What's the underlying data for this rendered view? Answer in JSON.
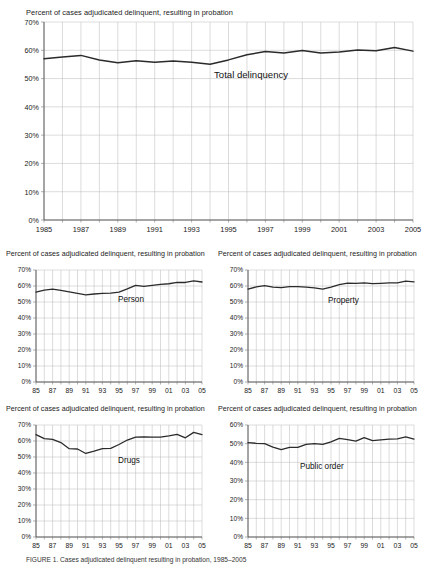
{
  "figure": {
    "caption": "FIGURE 1.  Cases adjudicated delinquent resulting in probation, 1985–2005"
  },
  "chart_data": [
    {
      "id": "total",
      "type": "line",
      "title": "Percent of cases adjudicated delinquent, resulting in probation",
      "series_label": "Total delinquency",
      "xlabel": "",
      "ylabel": "",
      "xlim": [
        1985,
        2005
      ],
      "ylim": [
        0,
        70
      ],
      "ytick_labels": [
        "0%",
        "10%",
        "20%",
        "30%",
        "40%",
        "50%",
        "60%",
        "70%"
      ],
      "ytick_values": [
        0,
        10,
        20,
        30,
        40,
        50,
        60,
        70
      ],
      "xtick_labels": [
        "1985",
        "1987",
        "1989",
        "1991",
        "1993",
        "1995",
        "1997",
        "1999",
        "2001",
        "2003",
        "2005"
      ],
      "xtick_values": [
        1985,
        1987,
        1989,
        1991,
        1993,
        1995,
        1997,
        1999,
        2001,
        2003,
        2005
      ],
      "grid": true,
      "legend": "inline-annotation",
      "x": [
        1985,
        1986,
        1987,
        1988,
        1989,
        1990,
        1991,
        1992,
        1993,
        1994,
        1995,
        1996,
        1997,
        1998,
        1999,
        2000,
        2001,
        2002,
        2003,
        2004,
        2005
      ],
      "values": [
        57.0,
        57.6,
        58.2,
        56.6,
        55.6,
        56.3,
        55.8,
        56.2,
        55.8,
        55.1,
        56.6,
        58.4,
        59.6,
        59.0,
        59.9,
        59.0,
        59.4,
        60.1,
        59.8,
        61.0,
        59.7
      ]
    },
    {
      "id": "person",
      "type": "line",
      "title": "Percent of cases adjudicated delinquent, resulting in probation",
      "series_label": "Person",
      "xlabel": "",
      "ylabel": "",
      "xlim": [
        1985,
        2005
      ],
      "ylim": [
        0,
        70
      ],
      "ytick_labels": [
        "0%",
        "10%",
        "20%",
        "30%",
        "40%",
        "50%",
        "60%",
        "70%"
      ],
      "ytick_values": [
        0,
        10,
        20,
        30,
        40,
        50,
        60,
        70
      ],
      "xtick_labels": [
        "85",
        "87",
        "89",
        "91",
        "93",
        "95",
        "97",
        "99",
        "01",
        "03",
        "05"
      ],
      "xtick_values": [
        1985,
        1987,
        1989,
        1991,
        1993,
        1995,
        1997,
        1999,
        2001,
        2003,
        2005
      ],
      "grid": true,
      "legend": "inline-annotation",
      "x": [
        1985,
        1986,
        1987,
        1988,
        1989,
        1990,
        1991,
        1992,
        1993,
        1994,
        1995,
        1996,
        1997,
        1998,
        1999,
        2000,
        2001,
        2002,
        2003,
        2004,
        2005
      ],
      "values": [
        56.2,
        57.4,
        58.0,
        57.2,
        56.3,
        55.4,
        54.5,
        55.0,
        55.4,
        55.6,
        56.2,
        58.2,
        60.4,
        59.8,
        60.4,
        61.0,
        61.4,
        62.3,
        62.2,
        63.2,
        62.5
      ]
    },
    {
      "id": "property",
      "type": "line",
      "title": "Percent of cases adjudicated delinquent, resulting in probation",
      "series_label": "Property",
      "xlabel": "",
      "ylabel": "",
      "xlim": [
        1985,
        2005
      ],
      "ylim": [
        0,
        70
      ],
      "ytick_labels": [
        "0%",
        "10%",
        "20%",
        "30%",
        "40%",
        "50%",
        "60%",
        "70%"
      ],
      "ytick_values": [
        0,
        10,
        20,
        30,
        40,
        50,
        60,
        70
      ],
      "xtick_labels": [
        "85",
        "87",
        "89",
        "91",
        "93",
        "95",
        "97",
        "99",
        "01",
        "03",
        "05"
      ],
      "xtick_values": [
        1985,
        1987,
        1989,
        1991,
        1993,
        1995,
        1997,
        1999,
        2001,
        2003,
        2005
      ],
      "grid": true,
      "legend": "inline-annotation",
      "x": [
        1985,
        1986,
        1987,
        1988,
        1989,
        1990,
        1991,
        1992,
        1993,
        1994,
        1995,
        1996,
        1997,
        1998,
        1999,
        2000,
        2001,
        2002,
        2003,
        2004,
        2005
      ],
      "values": [
        58.0,
        59.4,
        60.2,
        59.3,
        59.0,
        59.6,
        59.6,
        59.3,
        58.8,
        58.0,
        59.3,
        60.8,
        61.8,
        61.6,
        62.0,
        61.5,
        61.7,
        62.0,
        62.0,
        63.0,
        62.6
      ]
    },
    {
      "id": "drugs",
      "type": "line",
      "title": "Percent of cases adjudicated delinquent, resulting in probation",
      "series_label": "Drugs",
      "xlabel": "",
      "ylabel": "",
      "xlim": [
        1985,
        2005
      ],
      "ylim": [
        0,
        70
      ],
      "ytick_labels": [
        "0%",
        "10%",
        "20%",
        "30%",
        "40%",
        "50%",
        "60%",
        "70%"
      ],
      "ytick_values": [
        0,
        10,
        20,
        30,
        40,
        50,
        60,
        70
      ],
      "xtick_labels": [
        "85",
        "87",
        "89",
        "91",
        "93",
        "95",
        "97",
        "99",
        "01",
        "03",
        "05"
      ],
      "xtick_values": [
        1985,
        1987,
        1989,
        1991,
        1993,
        1995,
        1997,
        1999,
        2001,
        2003,
        2005
      ],
      "grid": true,
      "legend": "inline-annotation",
      "x": [
        1985,
        1986,
        1987,
        1988,
        1989,
        1990,
        1991,
        1992,
        1993,
        1994,
        1995,
        1996,
        1997,
        1998,
        1999,
        2000,
        2001,
        2002,
        2003,
        2004,
        2005
      ],
      "values": [
        64.0,
        61.5,
        61.0,
        59.0,
        55.2,
        55.0,
        52.2,
        53.6,
        55.2,
        55.4,
        57.8,
        60.6,
        62.4,
        62.6,
        62.4,
        62.4,
        63.2,
        64.2,
        62.0,
        65.4,
        64.0
      ]
    },
    {
      "id": "public-order",
      "type": "line",
      "title": "Percent of cases adjudicated delinquent, resulting in probation",
      "series_label": "Public order",
      "xlabel": "",
      "ylabel": "",
      "xlim": [
        1985,
        2005
      ],
      "ylim": [
        0,
        60
      ],
      "ytick_labels": [
        "0%",
        "10%",
        "20%",
        "30%",
        "40%",
        "50%",
        "60%"
      ],
      "ytick_values": [
        0,
        10,
        20,
        30,
        40,
        50,
        60
      ],
      "xtick_labels": [
        "85",
        "87",
        "89",
        "91",
        "93",
        "95",
        "97",
        "99",
        "01",
        "03",
        "05"
      ],
      "xtick_values": [
        1985,
        1987,
        1989,
        1991,
        1993,
        1995,
        1997,
        1999,
        2001,
        2003,
        2005
      ],
      "grid": true,
      "legend": "inline-annotation",
      "x": [
        1985,
        1986,
        1987,
        1988,
        1989,
        1990,
        1991,
        1992,
        1993,
        1994,
        1995,
        1996,
        1997,
        1998,
        1999,
        2000,
        2001,
        2002,
        2003,
        2004,
        2005
      ],
      "values": [
        50.6,
        50.2,
        50.0,
        48.2,
        46.8,
        48.0,
        48.0,
        49.6,
        50.0,
        49.6,
        51.0,
        52.8,
        52.2,
        51.4,
        53.2,
        51.6,
        52.0,
        52.4,
        52.6,
        53.6,
        52.4
      ]
    }
  ]
}
